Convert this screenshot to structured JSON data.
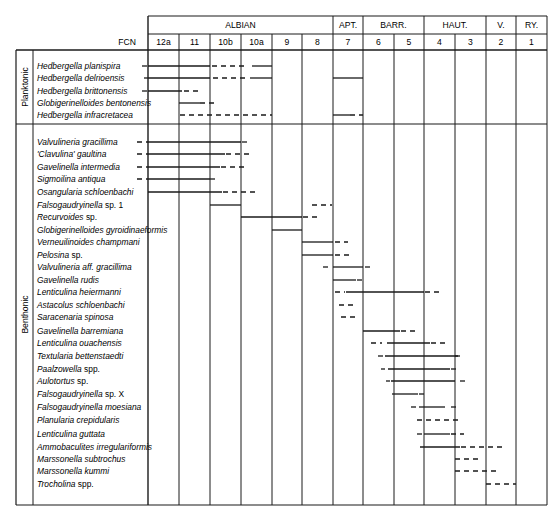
{
  "chart_data": {
    "type": "range-chart",
    "title": "",
    "xlabel": "FCN",
    "stages": [
      {
        "label": "ALBIAN",
        "zones": [
          "12a",
          "11",
          "10b",
          "10a",
          "9",
          "8"
        ]
      },
      {
        "label": "APT.",
        "zones": [
          "7"
        ]
      },
      {
        "label": "BARR.",
        "zones": [
          "6",
          "5"
        ]
      },
      {
        "label": "HAUT.",
        "zones": [
          "4",
          "3"
        ]
      },
      {
        "label": "V.",
        "zones": [
          "2"
        ]
      },
      {
        "label": "RY.",
        "zones": [
          "1"
        ]
      }
    ],
    "fcn_label": "FCN",
    "zones": [
      "12a",
      "11",
      "10b",
      "10a",
      "9",
      "8",
      "7",
      "6",
      "5",
      "4",
      "3",
      "2",
      "1"
    ],
    "groups": [
      {
        "label": "Planktonic",
        "start": 0,
        "end": 4
      },
      {
        "label": "Benthonic",
        "start": 5,
        "end": 35
      }
    ],
    "taxa": [
      {
        "name": "Hedbergella planispira",
        "y": 66,
        "segs": [
          [
            "d",
            142,
            148
          ],
          [
            "s",
            148,
            210
          ],
          [
            "d",
            212,
            245
          ],
          [
            "s",
            252,
            272
          ]
        ]
      },
      {
        "name": "Hedbergella delrioensis",
        "y": 78,
        "segs": [
          [
            "d",
            144,
            148
          ],
          [
            "s",
            148,
            210
          ],
          [
            "d",
            213,
            245
          ],
          [
            "s",
            250,
            272
          ],
          [
            "s",
            333,
            363
          ]
        ]
      },
      {
        "name": "Hedbergella brittonensis",
        "y": 91,
        "segs": [
          [
            "d",
            142,
            148
          ],
          [
            "s",
            148,
            182
          ],
          [
            "d",
            184,
            198
          ]
        ]
      },
      {
        "name": "Globigerinelloides bentonensis",
        "y": 103,
        "segs": [
          [
            "s",
            179,
            200
          ],
          [
            "d",
            200,
            217
          ]
        ]
      },
      {
        "name": "Hedbergella infracretacea",
        "y": 115,
        "segs": [
          [
            "d",
            180,
            272
          ],
          [
            "s",
            333,
            350
          ],
          [
            "d",
            350,
            363
          ]
        ]
      },
      {
        "name": "Valvulineria gracillima",
        "y": 142,
        "segs": [
          [
            "d",
            137,
            148
          ],
          [
            "s",
            148,
            241
          ],
          [
            "d",
            242,
            250
          ]
        ]
      },
      {
        "name": "'Clavulina' gaultina",
        "y": 154,
        "segs": [
          [
            "d",
            137,
            148
          ],
          [
            "s",
            148,
            225
          ],
          [
            "d",
            226,
            250
          ]
        ]
      },
      {
        "name": "Gavelinella intermedia",
        "y": 167,
        "segs": [
          [
            "d",
            137,
            148
          ],
          [
            "s",
            148,
            220
          ],
          [
            "d",
            221,
            248
          ]
        ]
      },
      {
        "name": "Sigmoilina antiqua",
        "y": 179,
        "segs": [
          [
            "d",
            137,
            148
          ],
          [
            "s",
            148,
            210
          ],
          [
            "d",
            210,
            218
          ]
        ]
      },
      {
        "name": "Osangularia schloenbachi",
        "y": 192,
        "segs": [
          [
            "s",
            148,
            222
          ],
          [
            "d",
            223,
            255
          ]
        ]
      },
      {
        "name": "Falsogaudryinella sp. 1",
        "y": 205,
        "segs": [
          [
            "s",
            210,
            241
          ],
          [
            "d",
            312,
            332
          ]
        ]
      },
      {
        "name": "Recurvoides sp.",
        "y": 217,
        "segs": [
          [
            "s",
            241,
            302
          ],
          [
            "d",
            303,
            318
          ]
        ]
      },
      {
        "name": "Globigerinelloides gyroidinaeformis",
        "y": 230,
        "segs": [
          [
            "s",
            272,
            302
          ]
        ]
      },
      {
        "name": "Verneuilinoides champmani",
        "y": 242,
        "segs": [
          [
            "s",
            302,
            333
          ],
          [
            "d",
            335,
            348
          ]
        ]
      },
      {
        "name": "Pelosina sp.",
        "y": 255,
        "segs": [
          [
            "s",
            302,
            333
          ],
          [
            "d",
            335,
            350
          ]
        ]
      },
      {
        "name": "Valvulineria aff. gracillima",
        "y": 267,
        "segs": [
          [
            "d",
            323,
            330
          ],
          [
            "s",
            333,
            363
          ],
          [
            "d",
            365,
            370
          ]
        ]
      },
      {
        "name": "Gavelinella rudis",
        "y": 280,
        "segs": [
          [
            "s",
            333,
            356
          ],
          [
            "d",
            357,
            365
          ]
        ]
      },
      {
        "name": "Lenticulina heiermanni",
        "y": 292,
        "segs": [
          [
            "d",
            335,
            345
          ],
          [
            "s",
            346,
            424
          ],
          [
            "d",
            425,
            440
          ]
        ]
      },
      {
        "name": "Astacolus schloenbachi",
        "y": 305,
        "segs": [
          [
            "d",
            339,
            357
          ]
        ]
      },
      {
        "name": "Saracenaria spinosa",
        "y": 317,
        "segs": [
          [
            "d",
            341,
            357
          ]
        ]
      },
      {
        "name": "Gavelinella barremiana",
        "y": 331,
        "segs": [
          [
            "s",
            363,
            400
          ],
          [
            "d",
            401,
            416
          ]
        ]
      },
      {
        "name": "Lenticulina ouachensis",
        "y": 343,
        "segs": [
          [
            "d",
            371,
            382
          ],
          [
            "s",
            387,
            430
          ],
          [
            "d",
            431,
            445
          ]
        ]
      },
      {
        "name": "Textularia bettenstaedti",
        "y": 356,
        "segs": [
          [
            "d",
            378,
            383
          ],
          [
            "s",
            385,
            458
          ],
          [
            "d",
            455,
            460
          ]
        ]
      },
      {
        "name": "Paalzowella spp.",
        "y": 369,
        "segs": [
          [
            "d",
            381,
            385
          ],
          [
            "s",
            388,
            450
          ],
          [
            "d",
            451,
            457
          ]
        ]
      },
      {
        "name": "Aulotortus sp.",
        "y": 381,
        "segs": [
          [
            "d",
            386,
            390
          ],
          [
            "s",
            391,
            455
          ],
          [
            "d",
            460,
            465
          ]
        ]
      },
      {
        "name": "Falsogaudryinella sp. X",
        "y": 394,
        "segs": [
          [
            "s",
            392,
            418
          ],
          [
            "d",
            419,
            424
          ]
        ]
      },
      {
        "name": "Falsogaudryinella moesiana",
        "y": 407,
        "segs": [
          [
            "d",
            411,
            418
          ],
          [
            "s",
            419,
            445
          ],
          [
            "d",
            451,
            458
          ]
        ]
      },
      {
        "name": "Planularia crepidularis",
        "y": 420,
        "segs": [
          [
            "d",
            417,
            458
          ]
        ]
      },
      {
        "name": "Lenticulina guttata",
        "y": 434,
        "segs": [
          [
            "d",
            417,
            424
          ],
          [
            "s",
            424,
            450
          ],
          [
            "d",
            451,
            464
          ]
        ]
      },
      {
        "name": "Ammobaculites irregulariformis",
        "y": 447,
        "segs": [
          [
            "s",
            420,
            460
          ],
          [
            "d",
            461,
            503
          ]
        ]
      },
      {
        "name": "Marssonella subtrochus",
        "y": 459,
        "segs": [
          [
            "d",
            455,
            478
          ]
        ]
      },
      {
        "name": "Marssonella kummi",
        "y": 471,
        "segs": [
          [
            "d",
            455,
            500
          ]
        ]
      },
      {
        "name": "Trocholina spp.",
        "y": 484,
        "segs": [
          [
            "d",
            486,
            516
          ]
        ]
      }
    ],
    "legend": {
      "solid": "recorded range",
      "dashed": "rare / sporadic occurrence"
    }
  }
}
